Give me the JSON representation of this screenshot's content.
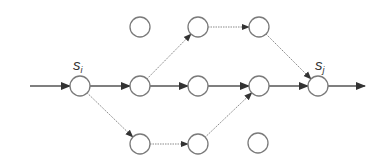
{
  "diagram": {
    "type": "directed-graph",
    "node_radius": 10,
    "colors": {
      "node_stroke": "#7a7a7a",
      "edge_solid": "#555555",
      "edge_dotted": "#8a8a8a",
      "arrow": "#333333"
    },
    "nodes": [
      {
        "id": "si",
        "x": 80,
        "y": 86,
        "label": "s",
        "sub": "i"
      },
      {
        "id": "m1",
        "x": 140,
        "y": 86
      },
      {
        "id": "m2",
        "x": 198,
        "y": 86
      },
      {
        "id": "m3",
        "x": 259,
        "y": 86
      },
      {
        "id": "sj",
        "x": 318,
        "y": 86,
        "label": "s",
        "sub": "j"
      },
      {
        "id": "t0",
        "x": 140,
        "y": 27
      },
      {
        "id": "t1",
        "x": 198,
        "y": 27
      },
      {
        "id": "t2",
        "x": 259,
        "y": 27
      },
      {
        "id": "b1",
        "x": 140,
        "y": 144
      },
      {
        "id": "b2",
        "x": 198,
        "y": 144
      },
      {
        "id": "b3",
        "x": 258,
        "y": 143
      }
    ],
    "edges": [
      {
        "from": "in",
        "to": "si",
        "style": "solid"
      },
      {
        "from": "si",
        "to": "m1",
        "style": "solid"
      },
      {
        "from": "m1",
        "to": "m2",
        "style": "solid"
      },
      {
        "from": "m2",
        "to": "m3",
        "style": "solid"
      },
      {
        "from": "m3",
        "to": "sj",
        "style": "solid"
      },
      {
        "from": "sj",
        "to": "out",
        "style": "solid"
      },
      {
        "from": "m1",
        "to": "t1",
        "style": "dotted"
      },
      {
        "from": "t1",
        "to": "t2",
        "style": "dotted"
      },
      {
        "from": "t2",
        "to": "sj",
        "style": "dotted"
      },
      {
        "from": "si",
        "to": "b1",
        "style": "dotted"
      },
      {
        "from": "b1",
        "to": "b2",
        "style": "dotted"
      },
      {
        "from": "b2",
        "to": "m3",
        "style": "dotted"
      }
    ],
    "labels": {
      "si": {
        "main": "s",
        "sub": "i"
      },
      "sj": {
        "main": "s",
        "sub": "j"
      }
    }
  }
}
